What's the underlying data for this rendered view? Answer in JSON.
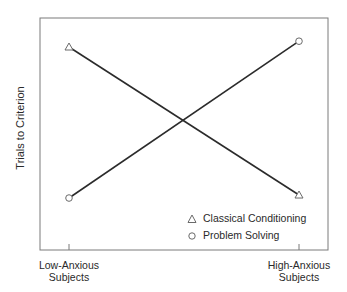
{
  "chart_data": {
    "type": "line",
    "title": "",
    "xlabel": "",
    "ylabel": "Trials to Criterion",
    "categories": [
      "Low-Anxious Subjects",
      "High-Anxious Subjects"
    ],
    "category_lines": [
      [
        "Low-Anxious",
        "Subjects"
      ],
      [
        "High-Anxious",
        "Subjects"
      ]
    ],
    "ylim": [
      0,
      10
    ],
    "y_ticks_shown": false,
    "grid": false,
    "legend_position": "lower right (inside plot)",
    "series": [
      {
        "name": "Classical Conditioning",
        "marker": "triangle",
        "values": [
          8.75,
          2.37
        ]
      },
      {
        "name": "Problem Solving",
        "marker": "circle",
        "values": [
          2.24,
          9.0
        ]
      }
    ],
    "note": "Conceptual interaction plot; y values are relative (no numeric scale shown)"
  },
  "colors": {
    "line": "#2b2b2b",
    "frame": "#7a7a7a",
    "marker": "#6a6a6a",
    "text": "#2a2a2a"
  }
}
